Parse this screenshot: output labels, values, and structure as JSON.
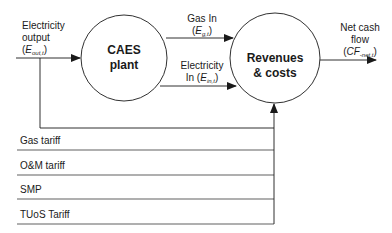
{
  "nodes": {
    "caes": {
      "line1": "CAES",
      "line2": "plant"
    },
    "revenues": {
      "line1": "Revenues",
      "line2": "& costs"
    }
  },
  "flows": {
    "electricity_output": {
      "line1": "Electricity",
      "line2": "output",
      "var": "E",
      "sub": "out,t"
    },
    "gas_in": {
      "line1": "Gas In",
      "var": "E",
      "sub": "g,t"
    },
    "electricity_in": {
      "line1": "Electricity",
      "line2_prefix": "In (",
      "var": "E",
      "sub": "in,t"
    },
    "net_cash_flow": {
      "line1": "Net cash",
      "line2": "flow",
      "var": "CF",
      "sub": "-net,t"
    }
  },
  "inputs": [
    {
      "label": "Gas tariff"
    },
    {
      "label": "O&M tariff"
    },
    {
      "label": "SMP"
    },
    {
      "label": "TUoS Tariff"
    }
  ],
  "colors": {
    "stroke": "#1a1a1a",
    "background": "#ffffff"
  }
}
